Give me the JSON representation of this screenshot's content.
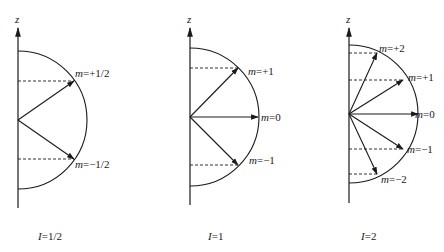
{
  "figure": {
    "axis_label": "z",
    "panels": [
      {
        "id": "spin-half",
        "caption_var": "I",
        "caption_val": "=1/2",
        "axis": {
          "x": 18,
          "top": 28,
          "bottom": 208
        },
        "center": {
          "x": 18,
          "y": 120
        },
        "radius": 69,
        "states": [
          {
            "m_var": "m",
            "m_val": "=+1/2",
            "tip": {
              "x": 74,
              "y": 81
            },
            "label": {
              "x": 75,
              "y": 77
            }
          },
          {
            "m_var": "m",
            "m_val": "=−1/2",
            "tip": {
              "x": 74,
              "y": 159
            },
            "label": {
              "x": 75,
              "y": 168
            }
          }
        ],
        "caption_pos": {
          "x": 38,
          "y": 240
        }
      },
      {
        "id": "spin-one",
        "caption_var": "I",
        "caption_val": "=1",
        "axis": {
          "x": 190,
          "top": 28,
          "bottom": 205
        },
        "center": {
          "x": 190,
          "y": 117
        },
        "radius": 69,
        "states": [
          {
            "m_var": "m",
            "m_val": "=+1",
            "tip": {
              "x": 238,
              "y": 68
            },
            "label": {
              "x": 248,
              "y": 75
            }
          },
          {
            "m_var": "m",
            "m_val": "=0",
            "tip": {
              "x": 258,
              "y": 117
            },
            "label": {
              "x": 261,
              "y": 121
            }
          },
          {
            "m_var": "m",
            "m_val": "=−1",
            "tip": {
              "x": 238,
              "y": 165
            },
            "label": {
              "x": 249,
              "y": 164
            }
          }
        ],
        "caption_pos": {
          "x": 208,
          "y": 240
        }
      },
      {
        "id": "spin-two",
        "caption_var": "I",
        "caption_val": "=2",
        "axis": {
          "x": 349,
          "top": 28,
          "bottom": 203
        },
        "center": {
          "x": 349,
          "y": 114
        },
        "radius": 69,
        "states": [
          {
            "m_var": "m",
            "m_val": "=+2",
            "tip": {
              "x": 377,
              "y": 53
            },
            "label": {
              "x": 379,
              "y": 52
            }
          },
          {
            "m_var": "m",
            "m_val": "=+1",
            "tip": {
              "x": 403,
              "y": 80
            },
            "label": {
              "x": 408,
              "y": 81
            }
          },
          {
            "m_var": "m",
            "m_val": "=0",
            "tip": {
              "x": 418,
              "y": 114
            },
            "label": {
              "x": 415,
              "y": 118
            }
          },
          {
            "m_var": "m",
            "m_val": "=−1",
            "tip": {
              "x": 403,
              "y": 149
            },
            "label": {
              "x": 407,
              "y": 153
            }
          },
          {
            "m_var": "m",
            "m_val": "=−2",
            "tip": {
              "x": 377,
              "y": 174
            },
            "label": {
              "x": 381,
              "y": 183
            }
          }
        ],
        "caption_pos": {
          "x": 361,
          "y": 240
        }
      }
    ]
  }
}
